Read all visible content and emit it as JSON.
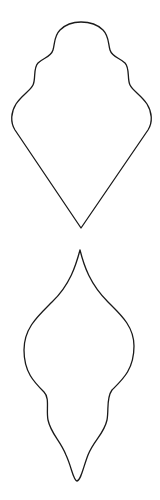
{
  "canvas": {
    "width": 160,
    "height": 500,
    "background": "#ffffff"
  },
  "shapes": [
    {
      "name": "scalloped-diamond-template",
      "stroke": "#1a1a1a",
      "path": "M 81 228 L 15 130 C 10 122 11 112 16 104 C 22 95 30 91 33 85 C 36 79 33 68 38 63 C 43 58 51 57 53 50 C 55 43 54 36 60 30 C 66 24 73 22 81 22 C 89 22 97 24 103 30 C 109 36 108 43 110 50 C 112 57 120 58 125 63 C 130 68 127 79 130 85 C 133 91 141 95 147 104 C 152 112 153 122 148 130 Z"
    },
    {
      "name": "ornament-drop-template",
      "stroke": "#1a1a1a",
      "path": "M 80 250 C 76 265 70 285 52 302 C 38 316 24 328 24 350 C 24 372 34 382 44 392 C 50 398 46 410 48 420 C 51 434 60 440 66 455 C 72 468 73 480 77 481 C 81 480 83 468 88 455 C 94 440 104 434 107 420 C 109 410 106 398 112 390 C 122 380 134 370 134 346 C 134 326 120 314 108 302 C 90 284 84 266 80 250 Z"
    }
  ]
}
